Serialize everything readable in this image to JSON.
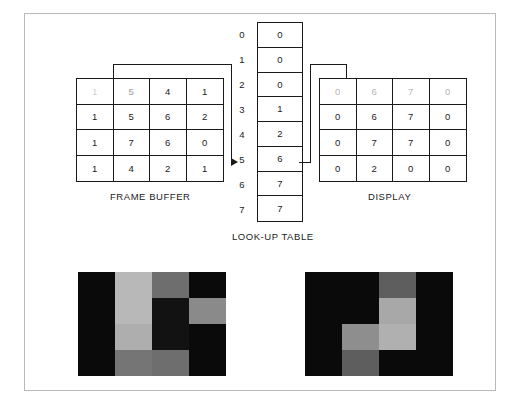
{
  "figure": {
    "frame_buffer": {
      "caption": "FRAME BUFFER",
      "rows": [
        [
          "1",
          "5",
          "4",
          "1"
        ],
        [
          "1",
          "5",
          "6",
          "2"
        ],
        [
          "1",
          "7",
          "6",
          "0"
        ],
        [
          "1",
          "4",
          "2",
          "1"
        ]
      ]
    },
    "lookup_table": {
      "caption": "LOOK-UP TABLE",
      "indices": [
        "0",
        "1",
        "2",
        "3",
        "4",
        "5",
        "6",
        "7"
      ],
      "values": [
        "0",
        "0",
        "0",
        "1",
        "2",
        "6",
        "7",
        "7"
      ],
      "highlighted_index": "5"
    },
    "display": {
      "caption": "DISPLAY",
      "rows": [
        [
          "0",
          "6",
          "7",
          "0"
        ],
        [
          "0",
          "6",
          "7",
          "0"
        ],
        [
          "0",
          "7",
          "7",
          "0"
        ],
        [
          "0",
          "2",
          "0",
          "0"
        ]
      ]
    },
    "raster_left": {
      "name": "frame-buffer-raster-image",
      "rows": [
        [
          "#0a0a0a",
          "#b8b8b8",
          "#6e6e6e",
          "#0a0a0a"
        ],
        [
          "#0a0a0a",
          "#b8b8b8",
          "#121212",
          "#8a8a8a"
        ],
        [
          "#0a0a0a",
          "#aeaeae",
          "#121212",
          "#0a0a0a"
        ],
        [
          "#0a0a0a",
          "#757575",
          "#6e6e6e",
          "#0a0a0a"
        ]
      ]
    },
    "raster_right": {
      "name": "display-raster-image",
      "rows": [
        [
          "#0a0a0a",
          "#0a0a0a",
          "#5e5e5e",
          "#0a0a0a"
        ],
        [
          "#0a0a0a",
          "#0a0a0a",
          "#a8a8a8",
          "#0a0a0a"
        ],
        [
          "#0a0a0a",
          "#8e8e8e",
          "#b0b0b0",
          "#0a0a0a"
        ],
        [
          "#0a0a0a",
          "#5e5e5e",
          "#0a0a0a",
          "#0a0a0a"
        ]
      ]
    },
    "colors": {
      "ink": "#1a1a1a",
      "border": "#b9b9b9",
      "background": "#ffffff"
    }
  }
}
